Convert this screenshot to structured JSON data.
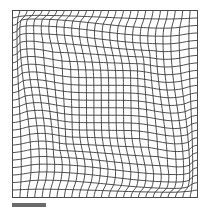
{
  "figure": {
    "type": "deformation-grid",
    "grid": {
      "x0": 12.5,
      "y0": 10.5,
      "x1": 197.5,
      "y1": 197.5,
      "columns": 25,
      "rows": 25,
      "line_color": "#3a3a3a"
    },
    "deformation": {
      "inner_box": {
        "x0": 38,
        "y0": 35,
        "x1": 170,
        "y1": 170
      },
      "strength": 7.5,
      "falloff": 18
    },
    "scale_bar": {
      "x": 12,
      "y": 203,
      "width": 34,
      "height": 4,
      "color": "#6a6a6a"
    }
  }
}
